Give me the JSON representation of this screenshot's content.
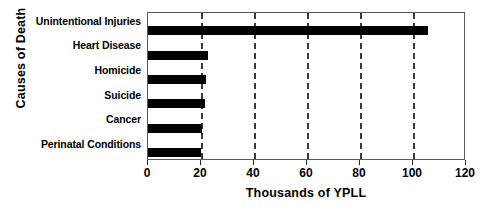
{
  "chart_data": {
    "type": "bar",
    "orientation": "horizontal",
    "title": "",
    "xlabel": "Thousands of YPLL",
    "ylabel": "Causes of Death",
    "categories": [
      "Unintentional Injuries",
      "Heart Disease",
      "Homicide",
      "Suicide",
      "Cancer",
      "Perinatal Conditions"
    ],
    "values": [
      105.5,
      22.5,
      22,
      21.5,
      20.5,
      20
    ],
    "xlim": [
      0,
      120
    ],
    "xticks": [
      0,
      20,
      40,
      60,
      80,
      100,
      120
    ],
    "xtick_labels": [
      "0",
      "20",
      "40",
      "60",
      "80",
      "100",
      "120"
    ],
    "gridlines": [
      20,
      40,
      60,
      80,
      100
    ],
    "grid": true,
    "grid_style": "dashed-vertical",
    "legend": null,
    "bar_color": "#000000",
    "frame_color": "#5a5a5a"
  }
}
